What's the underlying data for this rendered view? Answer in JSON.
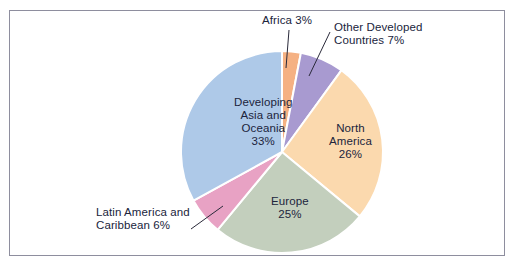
{
  "figure": {
    "background_color": "#ffffff",
    "frame_color": "#8e8e9e",
    "text_color": "#20243c",
    "separator_color": "#ffffff"
  },
  "chart_data": {
    "type": "pie",
    "title": "",
    "subtitle": "",
    "xlabel": "",
    "ylabel": "",
    "legend_position": "none",
    "grid": false,
    "units": "percent",
    "total": 100,
    "start_angle_deg": 0,
    "direction": "clockwise",
    "center": {
      "x": 282,
      "y": 152
    },
    "radius": 101,
    "slices": [
      {
        "name": "Africa",
        "label": "Africa 3%",
        "value": 3,
        "color": "#f5b183",
        "label_placement": "external",
        "label_text": "Africa 3%",
        "label_x": 262,
        "label_y": 14,
        "leader_from_x": 289,
        "leader_from_y": 30,
        "leader_to_x": 286,
        "leader_to_y": 68
      },
      {
        "name": "Other Developed Countries",
        "label": "Other Developed Countries 7%",
        "value": 7,
        "color": "#a89ad0",
        "label_placement": "external",
        "label_text": "Other Developed\nCountries 7%",
        "label_x": 334,
        "label_y": 21,
        "leader_from_x": 330,
        "leader_from_y": 32,
        "leader_to_x": 309,
        "leader_to_y": 76
      },
      {
        "name": "North America",
        "label": "North America 26%",
        "value": 26,
        "color": "#fbd9ae",
        "label_placement": "internal",
        "label_text": "North\nAmerica\n26%",
        "label_x": 329,
        "label_y": 122
      },
      {
        "name": "Europe",
        "label": "Europe 25%",
        "value": 25,
        "color": "#c3cfbd",
        "label_placement": "internal",
        "label_text": "Europe\n25%",
        "label_x": 271,
        "label_y": 195
      },
      {
        "name": "Latin America and Caribbean",
        "label": "Latin America and Caribbean 6%",
        "value": 6,
        "color": "#e8a2c4",
        "label_placement": "external",
        "label_text": "Latin America and\nCaribbean 6%",
        "label_x": 96,
        "label_y": 206,
        "leader_from_x": 191,
        "leader_from_y": 229,
        "leader_to_x": 223,
        "leader_to_y": 206
      },
      {
        "name": "Developing Asia and Oceania",
        "label": "Developing Asia and Oceania 33%",
        "value": 33,
        "color": "#aec9e8",
        "label_placement": "internal",
        "label_text": "Developing\nAsia and\nOceania\n33%",
        "label_x": 234,
        "label_y": 96
      }
    ]
  }
}
